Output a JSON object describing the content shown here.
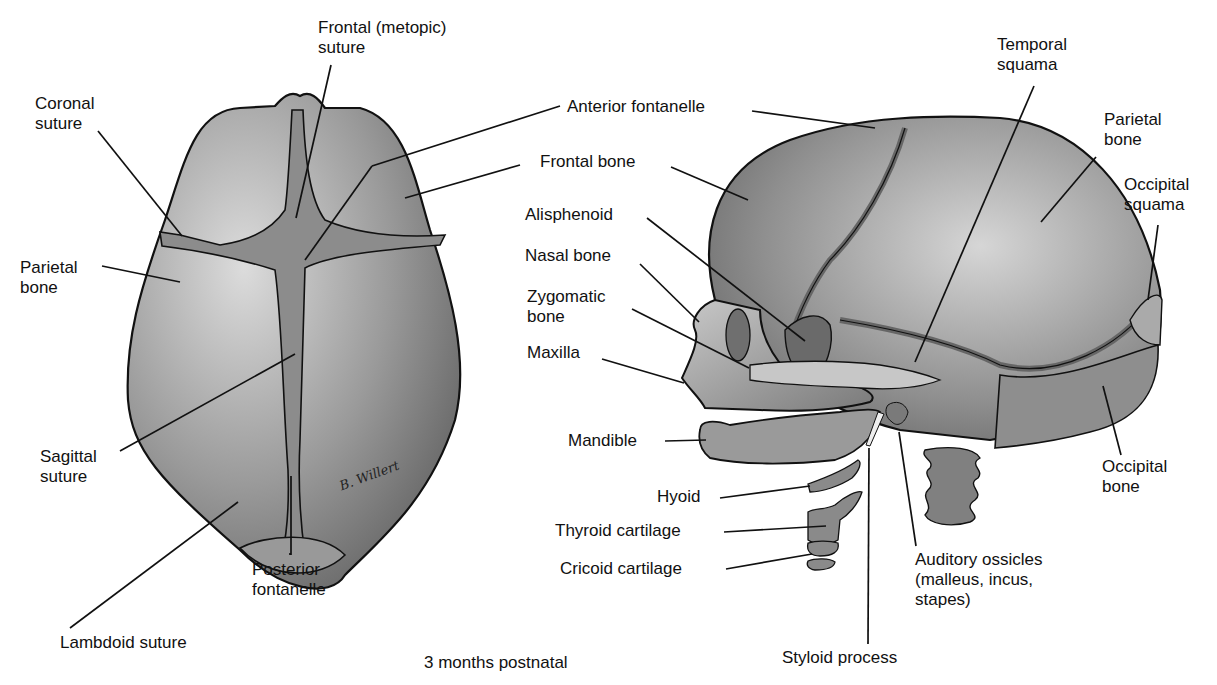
{
  "figure": {
    "caption": "3 months postnatal",
    "signature": "B. Willert"
  },
  "superior_view": {
    "labels": [
      {
        "id": "frontal-metopic-suture",
        "text": "Frontal (metopic)\nsuture"
      },
      {
        "id": "coronal-suture",
        "text": "Coronal\nsuture"
      },
      {
        "id": "parietal-bone",
        "text": "Parietal\nbone"
      },
      {
        "id": "sagittal-suture",
        "text": "Sagittal\nsuture"
      },
      {
        "id": "posterior-fontanelle",
        "text": "Posterior\nfontanelle"
      },
      {
        "id": "lambdoid-suture",
        "text": "Lambdoid suture"
      }
    ]
  },
  "lateral_view": {
    "labels": [
      {
        "id": "anterior-fontanelle",
        "text": "Anterior fontanelle"
      },
      {
        "id": "frontal-bone",
        "text": "Frontal bone"
      },
      {
        "id": "alisphenoid",
        "text": "Alisphenoid"
      },
      {
        "id": "nasal-bone",
        "text": "Nasal bone"
      },
      {
        "id": "zygomatic-bone",
        "text": "Zygomatic\nbone"
      },
      {
        "id": "maxilla",
        "text": "Maxilla"
      },
      {
        "id": "mandible",
        "text": "Mandible"
      },
      {
        "id": "hyoid",
        "text": "Hyoid"
      },
      {
        "id": "thyroid-cartilage",
        "text": "Thyroid cartilage"
      },
      {
        "id": "cricoid-cartilage",
        "text": "Cricoid cartilage"
      },
      {
        "id": "temporal-squama",
        "text": "Temporal\nsquama"
      },
      {
        "id": "parietal-bone",
        "text": "Parietal\nbone"
      },
      {
        "id": "occipital-squama",
        "text": "Occipital\nsquama"
      },
      {
        "id": "occipital-bone",
        "text": "Occipital\nbone"
      },
      {
        "id": "auditory-ossicles",
        "text": "Auditory ossicles\n(malleus, incus,\nstapes)"
      },
      {
        "id": "styloid-process",
        "text": "Styloid process"
      }
    ]
  },
  "colors": {
    "bone_light": "#bdbdbd",
    "bone_dark": "#6e6e6e",
    "suture": "#8a8a8a",
    "outline": "#111111"
  }
}
